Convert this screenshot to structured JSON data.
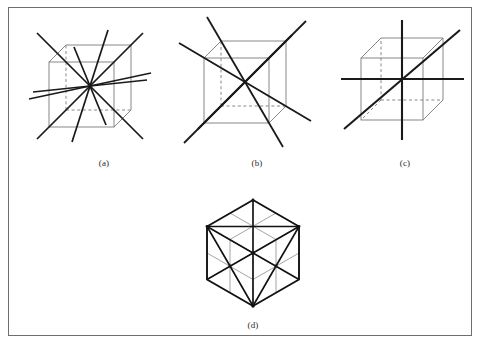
{
  "figure": {
    "background_color": "#ffffff",
    "border_color": "#6e6e6e",
    "edge_color": "#7a7a7a",
    "hidden_edge_color": "#7a7a7a",
    "axis_color": "#1a1a1a",
    "mirror_color": "#8a8a8a",
    "outline_color": "#1a1a1a"
  },
  "panels": [
    {
      "id": "a",
      "caption": "(a)",
      "description": "cube with six two-fold rotation axes through midpoints of opposite edges",
      "axis_count": 6,
      "axis_order": 2,
      "cube": {
        "front": {
          "x": 48,
          "y": 62,
          "w": 65,
          "h": 65
        },
        "depth_dx": 17,
        "depth_dy": -17
      },
      "caption_pos": {
        "x": 95,
        "y": 157
      }
    },
    {
      "id": "b",
      "caption": "(b)",
      "description": "cube with four three-fold rotation axes along the body diagonals",
      "axis_count": 4,
      "axis_order": 3,
      "cube": {
        "front": {
          "x": 203,
          "y": 58,
          "w": 65,
          "h": 65
        },
        "depth_dx": 17,
        "depth_dy": -17
      },
      "caption_pos": {
        "x": 248,
        "y": 157
      }
    },
    {
      "id": "c",
      "caption": "(c)",
      "description": "cube with three four-fold rotation axes through centres of opposite faces",
      "axis_count": 3,
      "axis_order": 4,
      "cube": {
        "front": {
          "x": 352,
          "y": 60,
          "w": 62,
          "h": 62
        },
        "depth_dx": 20,
        "depth_dy": -20
      },
      "caption_pos": {
        "x": 396,
        "y": 157
      }
    },
    {
      "id": "d",
      "caption": "(d)",
      "description": "cube viewed along a body diagonal showing the mirror planes",
      "hexagon": {
        "cx": 244,
        "cy": 252,
        "r": 53
      },
      "caption_pos": {
        "x": 244,
        "y": 319
      }
    }
  ]
}
